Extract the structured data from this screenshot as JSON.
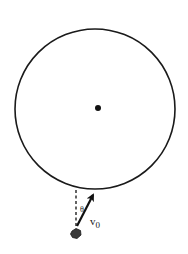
{
  "diagram": {
    "type": "physics-projectile-toward-planet",
    "circle": {
      "cx": 95,
      "cy": 109,
      "r": 80,
      "stroke": "#1a1a1a",
      "stroke_width": 1.6
    },
    "center_dot": {
      "cx": 98,
      "cy": 108,
      "r": 3,
      "fill": "#111111"
    },
    "dashed_line": {
      "x1": 76,
      "y1": 190,
      "x2": 76,
      "y2": 227,
      "stroke": "#222222"
    },
    "velocity_arrow": {
      "x1": 77,
      "y1": 226,
      "x2": 94,
      "y2": 193,
      "stroke": "#111111"
    },
    "projectile": {
      "cx": 76,
      "cy": 234,
      "r": 5,
      "fill": "#333333"
    },
    "labels": {
      "angle": "θ",
      "velocity_symbol": "v",
      "velocity_subscript": "0"
    }
  }
}
